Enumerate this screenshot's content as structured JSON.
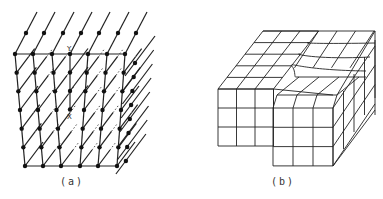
{
  "figure": {
    "panel_a": {
      "label": "(a)",
      "markers": {
        "top": "Y",
        "bottom": "X"
      },
      "description": "Lattice of atoms (dots) with an extra half-plane; columns terminate at X, edge dislocation line along X–Y"
    },
    "panel_b": {
      "label": "(b)",
      "description": "Block of cubic cells with a screw-dislocation step on the top surface"
    },
    "colors": {
      "line": "#222222",
      "background": "#ffffff"
    }
  }
}
